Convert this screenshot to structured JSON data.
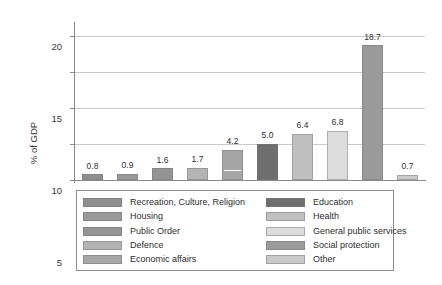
{
  "chart_data": {
    "type": "bar",
    "title": "",
    "xlabel": "",
    "ylabel": "% of GDP",
    "ylim": [
      0,
      21.5
    ],
    "yticks": [
      0,
      5,
      10,
      15,
      20
    ],
    "ytick_labels": [
      "0",
      "5",
      "10",
      "15",
      "20"
    ],
    "grid": true,
    "legend_position": "bottom",
    "categories": [
      "Recreation, Culture, Religion",
      "Housing",
      "Public Order",
      "Defence",
      "Economic affairs",
      "Education",
      "Health",
      "General public services",
      "Social protection",
      "Other"
    ],
    "values": [
      0.8,
      0.9,
      1.6,
      1.7,
      4.2,
      5.0,
      6.4,
      6.8,
      18.7,
      0.7
    ],
    "value_labels": [
      "0.8",
      "0.9",
      "1.6",
      "1.7",
      "4.2",
      "5.0",
      "6.4",
      "6.8",
      "18.7",
      "0.7"
    ],
    "colors": [
      "#8f8f8f",
      "#999999",
      "#949494",
      "#b4b4b4",
      "#a6a6a6",
      "#6e6e6e",
      "#c0c0c0",
      "#dcdcdc",
      "#9a9a9a",
      "#cacaca"
    ]
  },
  "axis": {
    "y_title": "% of GDP"
  },
  "legend": {
    "left_column": [
      {
        "label": "Recreation, Culture, Religion",
        "color": "#8f8f8f"
      },
      {
        "label": "Housing",
        "color": "#999999"
      },
      {
        "label": "Public Order",
        "color": "#949494"
      },
      {
        "label": "Defence",
        "color": "#b4b4b4"
      },
      {
        "label": "Economic affairs",
        "color": "#a6a6a6"
      }
    ],
    "right_column": [
      {
        "label": "Education",
        "color": "#6e6e6e"
      },
      {
        "label": "Health",
        "color": "#c0c0c0"
      },
      {
        "label": "General public services",
        "color": "#dcdcdc"
      },
      {
        "label": "Social protection",
        "color": "#9a9a9a"
      },
      {
        "label": "Other",
        "color": "#cacaca"
      }
    ]
  }
}
